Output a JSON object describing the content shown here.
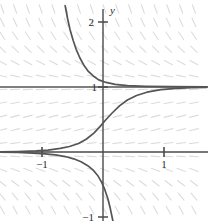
{
  "figure": {
    "name": "slope-field-plot",
    "background_color": "#ffffff",
    "axis_color": "#4a4a4a",
    "curve_color": "#555555",
    "slope_field_color": "#dcdcdc",
    "equilibrium_color": "#555555"
  },
  "axes": {
    "x_axis_label": "t",
    "y_axis_label": "y",
    "origin_px": [
      103,
      152
    ],
    "unit_px_x": 61,
    "unit_px_y": 65,
    "x_ticks": [
      {
        "value": -1,
        "label": "−1",
        "px": 42
      },
      {
        "value": 1,
        "label": "1",
        "px": 164
      }
    ],
    "y_ticks": [
      {
        "value": 2,
        "label": "2",
        "px": 21
      },
      {
        "value": 1,
        "label": "1",
        "px": 87
      },
      {
        "value": -1,
        "label": "−1",
        "px": 208
      }
    ],
    "xlim": [
      -1.7,
      1.75
    ],
    "ylim": [
      -1.15,
      2.2
    ]
  },
  "chart_data": {
    "type": "line",
    "title": "",
    "xlabel": "t",
    "ylabel": "y",
    "xlim": [
      -1.7,
      1.75
    ],
    "ylim": [
      -1.15,
      2.2
    ],
    "grid": false,
    "legend": "none",
    "xticks": [
      -1,
      1
    ],
    "xticklabels": [
      "−1",
      "1"
    ],
    "yticks": [
      -1,
      1,
      2
    ],
    "yticklabels": [
      "−1",
      "1",
      "2"
    ],
    "slope_field": {
      "description": "direction field, slope depends only on y",
      "formula": "dy/dt = y*(1-y)",
      "x_range": [
        -1.65,
        1.7
      ],
      "y_range": [
        -1.1,
        2.2
      ],
      "x_steps": 17,
      "y_steps": 17,
      "segment_length_px": 9,
      "color": "#dcdcdc"
    },
    "series": [
      {
        "name": "upper-solution-curve",
        "description": "decays from above toward the equilibrium y=1",
        "points": [
          [
            -0.62,
            2.25
          ],
          [
            -0.58,
            2.05
          ],
          [
            -0.54,
            1.88
          ],
          [
            -0.49,
            1.72
          ],
          [
            -0.44,
            1.58
          ],
          [
            -0.38,
            1.45
          ],
          [
            -0.31,
            1.33
          ],
          [
            -0.24,
            1.24
          ],
          [
            -0.16,
            1.17
          ],
          [
            -0.07,
            1.11
          ],
          [
            0.05,
            1.07
          ],
          [
            0.2,
            1.04
          ],
          [
            0.4,
            1.02
          ],
          [
            0.7,
            1.01
          ],
          [
            1.1,
            1.005
          ],
          [
            1.7,
            1.002
          ]
        ]
      },
      {
        "name": "middle-solution-curve",
        "description": "logistic S-curve rising from y=0 to y=1",
        "points": [
          [
            -1.7,
            0.004
          ],
          [
            -1.4,
            0.008
          ],
          [
            -1.1,
            0.018
          ],
          [
            -0.9,
            0.03
          ],
          [
            -0.7,
            0.055
          ],
          [
            -0.55,
            0.085
          ],
          [
            -0.4,
            0.13
          ],
          [
            -0.27,
            0.2
          ],
          [
            -0.15,
            0.29
          ],
          [
            -0.05,
            0.39
          ],
          [
            0.05,
            0.5
          ],
          [
            0.15,
            0.6
          ],
          [
            0.27,
            0.71
          ],
          [
            0.4,
            0.8
          ],
          [
            0.55,
            0.87
          ],
          [
            0.72,
            0.92
          ],
          [
            0.95,
            0.96
          ],
          [
            1.2,
            0.98
          ],
          [
            1.45,
            0.99
          ],
          [
            1.7,
            0.995
          ]
        ]
      },
      {
        "name": "lower-solution-curve",
        "description": "falls steeply below the t-axis toward negative infinity",
        "points": [
          [
            -1.7,
            -0.004
          ],
          [
            -1.4,
            -0.008
          ],
          [
            -1.15,
            -0.016
          ],
          [
            -0.95,
            -0.028
          ],
          [
            -0.78,
            -0.045
          ],
          [
            -0.62,
            -0.07
          ],
          [
            -0.48,
            -0.105
          ],
          [
            -0.36,
            -0.15
          ],
          [
            -0.25,
            -0.21
          ],
          [
            -0.16,
            -0.28
          ],
          [
            -0.08,
            -0.37
          ],
          [
            -0.02,
            -0.47
          ],
          [
            0.03,
            -0.58
          ],
          [
            0.08,
            -0.72
          ],
          [
            0.12,
            -0.87
          ],
          [
            0.16,
            -1.05
          ],
          [
            0.19,
            -1.2
          ]
        ]
      }
    ],
    "equilibrium_lines": [
      {
        "name": "equilibrium-y-equals-one",
        "y": 1,
        "x_from": -1.7,
        "x_to": 1.75
      },
      {
        "name": "equilibrium-y-equals-zero",
        "y": 0,
        "x_from": -1.7,
        "x_to": 1.75
      }
    ]
  }
}
